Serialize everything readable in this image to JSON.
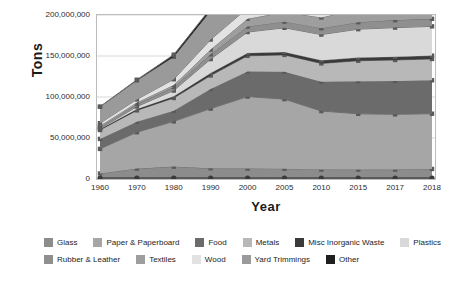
{
  "chart_data": {
    "type": "area",
    "title": "",
    "xlabel": "Year",
    "ylabel": "Tons",
    "stacked": true,
    "grid": true,
    "legend_position": "bottom",
    "categories": [
      "1960",
      "1970",
      "1980",
      "1990",
      "2000",
      "2005",
      "2010",
      "2015",
      "2017",
      "2018"
    ],
    "ylim": [
      0,
      200000000
    ],
    "yticks": [
      0,
      50000000,
      100000000,
      150000000,
      200000000
    ],
    "ytick_labels": [
      "0",
      "50,000,000",
      "100,000,000",
      "150,000,000",
      "200,000,000"
    ],
    "series": [
      {
        "name": "Glass",
        "color": "#8c8c8c",
        "values": [
          6720000,
          12740000,
          15130000,
          13100000,
          12770000,
          12540000,
          11530000,
          11470000,
          11440000,
          12250000
        ]
      },
      {
        "name": "Paper & Paperboard",
        "color": "#a6a6a6",
        "values": [
          29990000,
          44310000,
          55160000,
          72730000,
          87740000,
          84840000,
          71310000,
          68050000,
          67390000,
          67390000
        ]
      },
      {
        "name": "Food",
        "color": "#6b6b6b",
        "values": [
          12200000,
          12800000,
          13000000,
          23860000,
          30700000,
          33320000,
          35740000,
          39730000,
          40740000,
          40740000
        ]
      },
      {
        "name": "Metals",
        "color": "#b8b8b8",
        "values": [
          10820000,
          13830000,
          15510000,
          16550000,
          18980000,
          20620000,
          22370000,
          24930000,
          25570000,
          26010000
        ]
      },
      {
        "name": "Misc Inorganic Waste",
        "color": "#3a3a3a",
        "values": [
          1300000,
          1780000,
          2250000,
          2900000,
          3500000,
          3690000,
          3780000,
          4040000,
          4070000,
          4090000
        ]
      },
      {
        "name": "Plastics",
        "color": "#d9d9d9",
        "values": [
          390000,
          2900000,
          6830000,
          17130000,
          25550000,
          29380000,
          31400000,
          34500000,
          35410000,
          35680000
        ]
      },
      {
        "name": "Rubber & Leather",
        "color": "#8f8f8f",
        "values": [
          1840000,
          2970000,
          4200000,
          5790000,
          6670000,
          7520000,
          7780000,
          8470000,
          9160000,
          9180000
        ]
      },
      {
        "name": "Textiles",
        "color": "#9e9e9e",
        "values": [
          1760000,
          2040000,
          2530000,
          5810000,
          9480000,
          11730000,
          13120000,
          16030000,
          16890000,
          17030000
        ]
      },
      {
        "name": "Wood",
        "color": "#e2e2e2",
        "values": [
          3030000,
          3720000,
          7010000,
          12210000,
          13060000,
          14630000,
          15880000,
          17430000,
          18090000,
          18090000
        ]
      },
      {
        "name": "Yard Trimmings",
        "color": "#9a9a9a",
        "values": [
          20000000,
          23200000,
          27500000,
          35000000,
          30530000,
          32070000,
          33400000,
          34720000,
          35200000,
          35400000
        ]
      },
      {
        "name": "Other",
        "color": "#1f1f1f",
        "values": [
          70000,
          770000,
          2520000,
          3190000,
          4000000,
          4290000,
          4590000,
          4700000,
          4740000,
          4740000
        ]
      }
    ],
    "totals": [
      88120000,
      121060000,
      151640000,
      208270000,
      242980000,
      254630000,
      250900000,
      264070000,
      268700000,
      270600000
    ]
  },
  "legend": {
    "rows": [
      [
        {
          "label": "Glass",
          "color": "#8c8c8c"
        },
        {
          "label": "Paper & Paperboard",
          "color": "#a6a6a6"
        },
        {
          "label": "Food",
          "color": "#6b6b6b"
        },
        {
          "label": "Metals",
          "color": "#b8b8b8"
        },
        {
          "label": "Misc Inorganic Waste",
          "color": "#3a3a3a"
        },
        {
          "label": "Plastics",
          "color": "#d9d9d9"
        }
      ],
      [
        {
          "label": "Rubber & Leather",
          "color": "#8f8f8f"
        },
        {
          "label": "Textiles",
          "color": "#9e9e9e"
        },
        {
          "label": "Wood",
          "color": "#e2e2e2"
        },
        {
          "label": "Yard Trimmings",
          "color": "#9a9a9a"
        },
        {
          "label": "Other",
          "color": "#1f1f1f"
        }
      ]
    ]
  },
  "axes": {
    "y_title": "Tons",
    "x_title": "Year"
  },
  "style": {
    "grid_color": "#d8d8d8",
    "frame_color": "#bcbcbc",
    "marker_color": "#5a5a5a",
    "line_color": "#6f6f6f"
  }
}
